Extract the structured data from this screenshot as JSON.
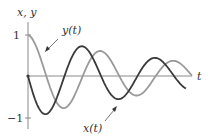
{
  "chart_data": {
    "type": "line",
    "title": "",
    "xlabel": "t",
    "ylabel": "x, y",
    "yticks": [
      {
        "value": 1,
        "label": "1"
      },
      {
        "value": -1,
        "label": "−1"
      }
    ],
    "ylim": [
      -1.25,
      1.3
    ],
    "xlim": [
      0,
      10
    ],
    "grid": false,
    "legend": "inline annotations with arrows",
    "series": [
      {
        "name": "x(t)",
        "label": "x(t)",
        "color": "#3a3a3a",
        "description": "damped oscillation starting at 0, first going negative",
        "points": [
          [
            0,
            0
          ],
          [
            1.0,
            -0.9
          ],
          [
            2.35,
            0.73
          ],
          [
            3.9,
            -0.56
          ],
          [
            5.55,
            0.48
          ],
          [
            6.8,
            0.07
          ]
        ]
      },
      {
        "name": "y(t)",
        "label": "y(t)",
        "color": "#9a9a9a",
        "description": "damped oscillation starting at 1",
        "points": [
          [
            0,
            1.0
          ],
          [
            1.65,
            -0.78
          ],
          [
            3.1,
            0.63
          ],
          [
            4.6,
            -0.49
          ],
          [
            6.1,
            0.34
          ],
          [
            7.0,
            0.15
          ]
        ]
      }
    ],
    "annotations": [
      {
        "text": "y(t)",
        "points_to": "y(t) curve near t≈0.6"
      },
      {
        "text": "x(t)",
        "points_to": "x(t) curve near its second minimum"
      }
    ]
  },
  "labels": {
    "axis_y": "x, y",
    "axis_x": "t",
    "tick_pos": "1",
    "tick_neg": "−1",
    "series_y": "y(t)",
    "series_x": "x(t)"
  },
  "style": {
    "axis_color": "#8a8a8a",
    "x_color": "#3a3a3a",
    "y_color": "#9a9a9a"
  }
}
